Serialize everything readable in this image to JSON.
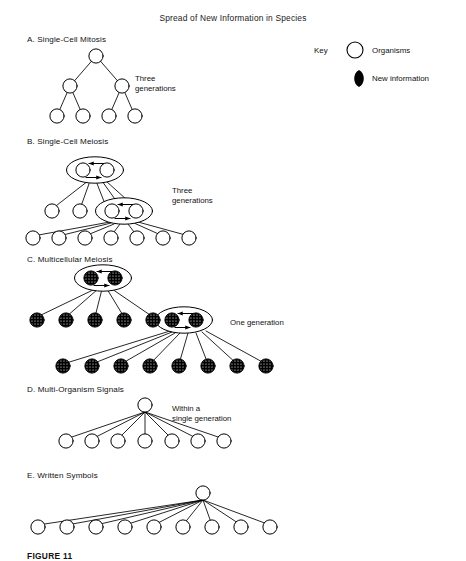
{
  "title": "Spread of New Information in Species",
  "caption": "FIGURE 11",
  "key": {
    "label": "Key",
    "organisms_label": "Organisms",
    "new_information_label": "New information",
    "organism_icon": "open-circle-icon",
    "new_information_icon": "filled-lens-icon"
  },
  "colors": {
    "ink": "#000000",
    "paper": "#ffffff",
    "text": "#111111"
  },
  "sections": [
    {
      "id": "a",
      "label": "A. Single-Cell Mitosis",
      "side_label": "Three\ngenerations",
      "node_style": "half-filled-circle",
      "generations": [
        1,
        2,
        4
      ],
      "total_nodes": 7,
      "paired_ellipses": 0,
      "arrows": 0
    },
    {
      "id": "b",
      "label": "B. Single-Cell Meiosis",
      "side_label": "Three\ngenerations",
      "node_style": "half-filled-circle",
      "generations": [
        2,
        5,
        7
      ],
      "total_nodes": 14,
      "paired_ellipses": 2,
      "arrows": 4
    },
    {
      "id": "c",
      "label": "C. Multicellular Meiosis",
      "side_label": "One generation",
      "node_style": "stippled-filled-circle",
      "generations": [
        2,
        5,
        8
      ],
      "total_nodes": 15,
      "paired_ellipses": 2,
      "arrows": 4
    },
    {
      "id": "d",
      "label": "D. Multi-Organism Signals",
      "side_label": "Within a\nsingle generation",
      "node_style": "half-filled-circle",
      "generations": [
        1,
        7
      ],
      "total_nodes": 8,
      "paired_ellipses": 0,
      "arrows": 0
    },
    {
      "id": "e",
      "label": "E. Written Symbols",
      "side_label": "",
      "node_style": "half-filled-circle",
      "generations": [
        1,
        9
      ],
      "total_nodes": 10,
      "paired_ellipses": 0,
      "arrows": 0
    }
  ]
}
